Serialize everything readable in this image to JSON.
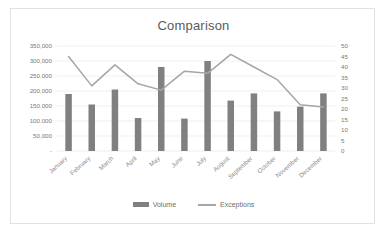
{
  "card": {
    "border_color": "#e2e2e2",
    "background": "#ffffff"
  },
  "chart_data": {
    "type": "bar",
    "title": "Comparison",
    "xlabel": "",
    "ylabel": "",
    "grid": true,
    "legend_position": "bottom",
    "categories": [
      "January",
      "February",
      "March",
      "April",
      "May",
      "June",
      "July",
      "August",
      "September",
      "October",
      "November",
      "December"
    ],
    "y_axis_left": {
      "label": "",
      "ylim": [
        0,
        350000
      ],
      "ticks": [
        0,
        50000,
        100000,
        150000,
        200000,
        250000,
        300000,
        350000
      ],
      "tick_labels": [
        "-",
        "50,000",
        "100,000",
        "150,000",
        "200,000",
        "250,000",
        "300,000",
        "350,000"
      ]
    },
    "y_axis_right": {
      "label": "",
      "ylim": [
        0,
        50
      ],
      "ticks": [
        0,
        5,
        10,
        15,
        20,
        25,
        30,
        35,
        40,
        45,
        50
      ],
      "tick_labels": [
        "0",
        "5",
        "10",
        "15",
        "20",
        "25",
        "30",
        "35",
        "40",
        "45",
        "50"
      ]
    },
    "series": [
      {
        "name": "Volume",
        "type": "bar",
        "axis": "left",
        "color": "#808080",
        "values": [
          190000,
          155000,
          205000,
          110000,
          280000,
          108000,
          300000,
          168000,
          192000,
          132000,
          148000,
          192000
        ]
      },
      {
        "name": "Exceptions",
        "type": "line",
        "axis": "right",
        "color": "#a6a6a6",
        "values": [
          45,
          31,
          41,
          32,
          29,
          38,
          37,
          46,
          40,
          34,
          22,
          21
        ]
      }
    ]
  },
  "legend": {
    "items": [
      {
        "label": "Volume",
        "marker": "bar-swatch",
        "color": "#808080"
      },
      {
        "label": "Exceptions",
        "marker": "line-swatch",
        "color": "#a6a6a6"
      }
    ]
  }
}
